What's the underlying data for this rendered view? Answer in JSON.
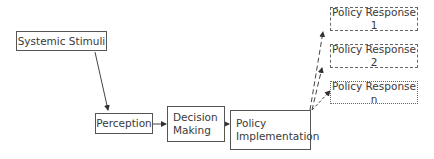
{
  "diagram": {
    "type": "flowchart",
    "nodes": [
      {
        "id": "stimuli",
        "label": "Systemic Stimuli",
        "style": "solid"
      },
      {
        "id": "perception",
        "label": "Perception",
        "style": "solid"
      },
      {
        "id": "decision",
        "label": "Decision Making",
        "line1": "Decision",
        "line2": "Making",
        "style": "solid"
      },
      {
        "id": "implementation",
        "label": "Policy Implementation",
        "line1": "Policy",
        "line2": "Implementation",
        "style": "solid"
      },
      {
        "id": "response1",
        "label": "Policy Response 1",
        "style": "dashed"
      },
      {
        "id": "response2",
        "label": "Policy Response 2",
        "style": "dashed"
      },
      {
        "id": "responsen",
        "label": "Policy Response n",
        "style": "dotted"
      }
    ],
    "edges": [
      {
        "from": "stimuli",
        "to": "perception",
        "style": "solid"
      },
      {
        "from": "perception",
        "to": "decision",
        "style": "solid"
      },
      {
        "from": "decision",
        "to": "implementation",
        "style": "solid"
      },
      {
        "from": "implementation",
        "to": "response1",
        "style": "dashed"
      },
      {
        "from": "implementation",
        "to": "response2",
        "style": "dashed"
      },
      {
        "from": "implementation",
        "to": "responsen",
        "style": "dotted"
      }
    ]
  }
}
